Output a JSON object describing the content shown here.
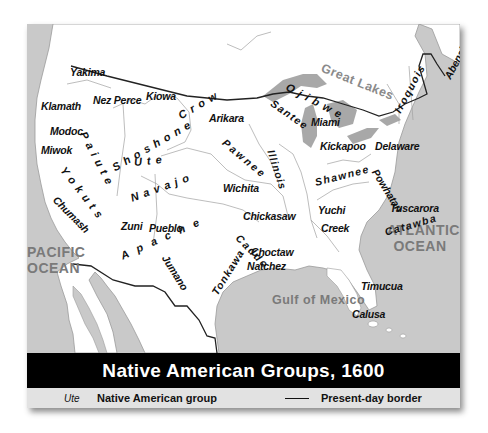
{
  "title": "Native American Groups, 1600",
  "legend": {
    "sample_label": "Ute",
    "group_label": "Native American group",
    "border_label": "Present-day border"
  },
  "water_bodies": {
    "great_lakes": "Great Lakes",
    "pacific_line1": "PACIFIC",
    "pacific_line2": "OCEAN",
    "atlantic_line1": "ATLANTIC",
    "atlantic_line2": "OCEAN",
    "gulf": "Gulf of Mexico"
  },
  "groups": {
    "yakima": "Yakima",
    "klamath": "Klamath",
    "nez_perce": "Nez Perce",
    "kiowa": "Kiowa",
    "crow": "Crow",
    "ojibwe": "Ojibwe",
    "modoc": "Modoc",
    "miwok": "Miwok",
    "paiute": "Paiute",
    "shoshone": "Shoshone",
    "arikara": "Arikara",
    "santee": "Santee",
    "miami": "Miami",
    "iroquois": "Iroquois",
    "abenaki": "Abenaki",
    "yokuts": "Yokuts",
    "ute": "Ute",
    "pawnee": "Pawnee",
    "illinois": "Illinois",
    "kickapoo": "Kickapoo",
    "delaware": "Delaware",
    "chumash": "Chumash",
    "navajo": "Navajo",
    "wichita": "Wichita",
    "powhatan": "Powhatan",
    "shawnee": "Shawnee",
    "zuni": "Zuni",
    "pueblo": "Pueblo",
    "apache": "Apache",
    "chickasaw": "Chickasaw",
    "yuchi": "Yuchi",
    "tuscarora": "Tuscarora",
    "creek": "Creek",
    "catawba": "Catawba",
    "caddo": "Caddo",
    "choctaw": "Choctaw",
    "natchez": "Natchez",
    "jumano": "Jumano",
    "tonkawa": "Tonkawa",
    "timucua": "Timucua",
    "calusa": "Calusa"
  },
  "colors": {
    "land": "#ffffff",
    "water": "#c9c9c9",
    "border": "#222222",
    "title_bar": "#000000",
    "legend_bar": "#e2e2e2",
    "water_label": "#7a7a7a"
  }
}
